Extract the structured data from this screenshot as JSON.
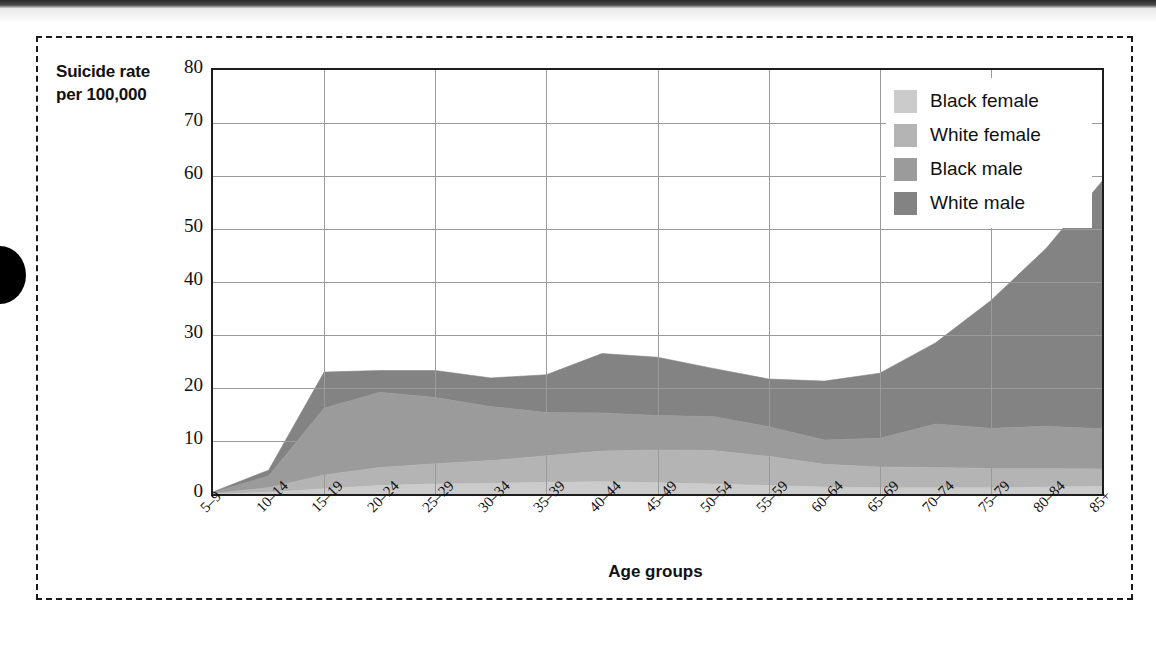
{
  "figure": {
    "y_axis_caption_line1": "Suicide rate",
    "y_axis_caption_line2": "per 100,000",
    "x_axis_caption": "Age groups"
  },
  "legend": {
    "position": "top-right",
    "items": [
      {
        "label": "Black female",
        "color": "#cbcbcb"
      },
      {
        "label": "White female",
        "color": "#b4b4b4"
      },
      {
        "label": "Black male",
        "color": "#9b9b9b"
      },
      {
        "label": "White male",
        "color": "#838383"
      }
    ]
  },
  "chart_data": {
    "type": "area",
    "stacked": true,
    "title": "",
    "xlabel": "Age groups",
    "ylabel": "Suicide rate per 100,000",
    "ylim": [
      0,
      80
    ],
    "yticks": [
      0,
      10,
      20,
      30,
      40,
      50,
      60,
      70,
      80
    ],
    "ytick_labels": [
      "0",
      "10",
      "20",
      "30",
      "40",
      "50",
      "60",
      "70",
      "80"
    ],
    "grid": true,
    "legend_position": "upper right",
    "categories": [
      "5–9",
      "10–14",
      "15–19",
      "20–24",
      "25–29",
      "30–34",
      "35–39",
      "40–44",
      "45–49",
      "50–54",
      "55–59",
      "60–64",
      "65–69",
      "70–74",
      "75–79",
      "80–84",
      "85+"
    ],
    "series": [
      {
        "name": "Black female",
        "color": "#cbcbcb",
        "values": [
          0.0,
          0.3,
          1.0,
          1.6,
          1.9,
          2.0,
          2.2,
          2.3,
          2.1,
          1.9,
          1.6,
          1.3,
          1.2,
          1.2,
          1.2,
          1.3,
          1.4
        ]
      },
      {
        "name": "White female",
        "color": "#b4b4b4",
        "values": [
          0.1,
          0.9,
          2.6,
          3.4,
          3.8,
          4.3,
          5.0,
          5.8,
          6.2,
          6.3,
          5.5,
          4.3,
          3.9,
          3.8,
          3.6,
          3.5,
          3.3
        ]
      },
      {
        "name": "Black male",
        "color": "#9b9b9b",
        "values": [
          0.2,
          2.2,
          12.6,
          14.2,
          12.5,
          10.2,
          8.2,
          7.2,
          6.5,
          6.4,
          5.6,
          4.6,
          5.4,
          8.2,
          7.6,
          8.0,
          7.6
        ]
      },
      {
        "name": "White male",
        "color": "#838383",
        "values": [
          0.1,
          1.1,
          6.8,
          4.1,
          5.1,
          5.4,
          7.1,
          11.2,
          11.0,
          9.1,
          9.0,
          11.1,
          12.3,
          15.3,
          24.1,
          33.6,
          46.7
        ]
      }
    ],
    "series_totals": [
      0.4,
      4.5,
      23.0,
      23.3,
      23.3,
      21.9,
      22.5,
      26.5,
      25.8,
      23.7,
      21.7,
      21.3,
      22.8,
      28.5,
      36.5,
      46.4,
      59.0
    ]
  }
}
